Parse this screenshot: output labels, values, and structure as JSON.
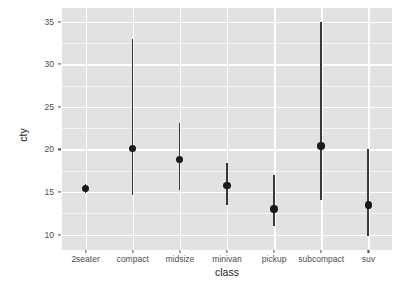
{
  "chart_data": {
    "type": "scatter",
    "plot_style": "pointrange",
    "title": "",
    "xlabel": "class",
    "ylabel": "cty",
    "categories": [
      "2seater",
      "compact",
      "midsize",
      "minivan",
      "pickup",
      "subcompact",
      "suv"
    ],
    "values": [
      15.4,
      20.1,
      18.8,
      15.8,
      13.0,
      20.4,
      13.5
    ],
    "range_low": [
      14.9,
      14.6,
      15.2,
      13.5,
      11.0,
      14.1,
      9.8
    ],
    "range_high": [
      15.9,
      33.0,
      23.1,
      18.4,
      17.0,
      34.9,
      20.0
    ],
    "series": [
      {
        "name": "cty by class",
        "points": [
          {
            "category": "2seater",
            "value": 15.4,
            "low": 14.9,
            "high": 15.9
          },
          {
            "category": "compact",
            "value": 20.1,
            "low": 14.6,
            "high": 33.0
          },
          {
            "category": "midsize",
            "value": 18.8,
            "low": 15.2,
            "high": 23.1
          },
          {
            "category": "minivan",
            "value": 15.8,
            "low": 13.5,
            "high": 18.4
          },
          {
            "category": "pickup",
            "value": 13.0,
            "low": 11.0,
            "high": 17.0
          },
          {
            "category": "subcompact",
            "value": 20.4,
            "low": 14.1,
            "high": 34.9
          },
          {
            "category": "suv",
            "value": 13.5,
            "low": 9.8,
            "high": 20.0
          }
        ]
      }
    ],
    "yticks": [
      10,
      15,
      20,
      25,
      30,
      35
    ],
    "ytick_labels": [
      "10",
      "15",
      "20",
      "25",
      "30",
      "35"
    ],
    "yminor": [
      12.5,
      17.5,
      22.5,
      27.5,
      32.5
    ],
    "ylim": [
      8.2,
      36.6
    ],
    "grid": true,
    "legend": "none",
    "colors": {
      "panel_background": "#e2e2e2",
      "major_gridline": "#ffffff",
      "minor_gridline": "#f3f3f3",
      "point": "#1a1a1a",
      "range_bar": "#3a3a3a",
      "axis_text": "#4d4d4d",
      "axis_title": "#1a1a1a",
      "page_background": "#ffffff"
    }
  }
}
